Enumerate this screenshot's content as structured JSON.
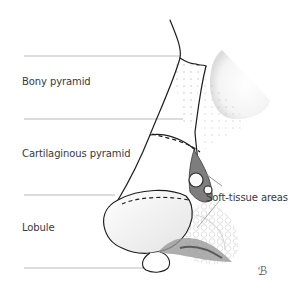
{
  "figure": {
    "labels": [
      {
        "id": "bony",
        "text": "Bony pyramid",
        "x": 22,
        "y": 82
      },
      {
        "id": "cartilaginous",
        "text": "Cartilaginous pyramid",
        "x": 22,
        "y": 151
      },
      {
        "id": "lobule",
        "text": "Lobule",
        "x": 22,
        "y": 226
      },
      {
        "id": "soft",
        "text": "Soft-tissue areas",
        "x": 206,
        "y": 194
      }
    ],
    "signature": "ℬ",
    "colors": {
      "line": "#1e1e1e",
      "guide": "#9a9a9a",
      "shade": "#7d7d7d",
      "text": "#3a3a3a"
    }
  }
}
